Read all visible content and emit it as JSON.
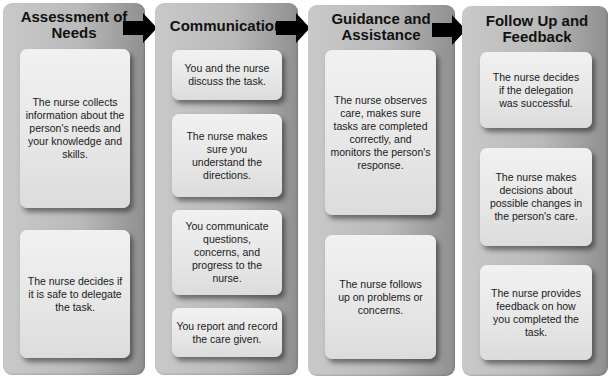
{
  "columns": [
    {
      "title": "Assessment of Needs",
      "cards": [
        "The nurse collects information about the person's needs and your knowledge and skills.",
        "The nurse decides if it is safe to delegate the task."
      ]
    },
    {
      "title": "Communication",
      "cards": [
        "You and the nurse discuss the task.",
        "The nurse makes sure you understand the directions.",
        "You communicate questions, concerns, and progress to the nurse.",
        "You report and record the care given."
      ]
    },
    {
      "title": "Guidance and Assistance",
      "cards": [
        "The nurse observes care, makes sure tasks are completed correctly, and monitors the person's response.",
        "The nurse follows up on problems or concerns."
      ]
    },
    {
      "title": "Follow Up and Feedback",
      "cards": [
        "The nurse decides if the delegation was successful.",
        "The nurse makes decisions about possible changes in the person's care.",
        "The nurse provides feedback on how you completed the task."
      ]
    }
  ],
  "colors": {
    "column_gray": "#b9b9b9",
    "card_light": "#e6e6e6",
    "arrow": "#000000",
    "text": "#1a1a1a"
  }
}
